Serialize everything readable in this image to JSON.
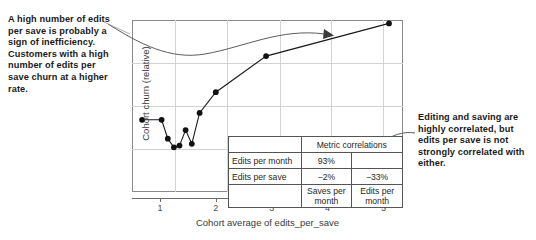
{
  "annotations": {
    "left": "A high number of edits per save is probably a sign of inefficiency. Customers with a high number of edits per save churn at a higher rate.",
    "right": "Editing and saving are highly correlated, but edits per save is not strongly correlated with either."
  },
  "chart_data": {
    "type": "scatter",
    "title": "",
    "xlabel": "Cohort average of edits_per_save",
    "ylabel": "Cohort churn (relative)",
    "xlim": [
      0.5,
      5.35
    ],
    "ylim": [
      0,
      1
    ],
    "xticks": [
      1,
      2,
      3,
      4,
      5
    ],
    "xticklabels": [
      "1",
      "2",
      "3",
      "4",
      "5"
    ],
    "yticks": [],
    "yticklabels": [],
    "grid": true,
    "legend": null,
    "connected": true,
    "marker": "filled-circle",
    "x": [
      0.68,
      1.03,
      1.14,
      1.25,
      1.35,
      1.46,
      1.57,
      1.71,
      2.0,
      2.9,
      5.1
    ],
    "y": [
      0.42,
      0.42,
      0.31,
      0.26,
      0.27,
      0.36,
      0.28,
      0.46,
      0.58,
      0.79,
      0.98
    ],
    "annotation_arrow": "S-curve arrow from left callout into upper plot area",
    "series": [
      {
        "name": "Cohort churn vs edits_per_save",
        "points": [
          {
            "x": 0.68,
            "y": 0.42
          },
          {
            "x": 1.03,
            "y": 0.42
          },
          {
            "x": 1.14,
            "y": 0.31
          },
          {
            "x": 1.25,
            "y": 0.26
          },
          {
            "x": 1.35,
            "y": 0.27
          },
          {
            "x": 1.46,
            "y": 0.36
          },
          {
            "x": 1.57,
            "y": 0.28
          },
          {
            "x": 1.71,
            "y": 0.46
          },
          {
            "x": 2.0,
            "y": 0.58
          },
          {
            "x": 2.9,
            "y": 0.79
          },
          {
            "x": 5.1,
            "y": 0.98
          }
        ]
      }
    ]
  },
  "corr_table": {
    "header": "Metric correlations",
    "rows": [
      {
        "label": "Edits per month",
        "values": [
          "93%",
          ""
        ],
        "highlight": [
          true,
          false
        ]
      },
      {
        "label": "Edits per save",
        "values": [
          "−2%",
          "−33%"
        ],
        "highlight": [
          false,
          false
        ]
      }
    ],
    "column_headers": [
      "Saves per month",
      "Edits per month"
    ]
  }
}
